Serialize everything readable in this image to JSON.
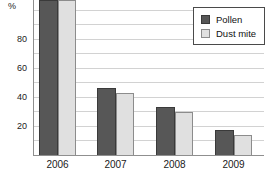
{
  "chart_data": {
    "type": "bar",
    "title": "",
    "categories": [
      "2006",
      "2007",
      "2008",
      "2009"
    ],
    "series": [
      {
        "name": "Pollen",
        "values": [
          100,
          46,
          33,
          17
        ],
        "color": "#575757",
        "border_color": "#3a3a3a"
      },
      {
        "name": "Dust mite",
        "values": [
          100,
          43,
          30,
          14
        ],
        "color": "#e0e0e0",
        "border_color": "#8c8c8c"
      }
    ],
    "ylabel": "%",
    "xlabel": "",
    "ylim": [
      0,
      100
    ],
    "ytick_labels": [
      "20",
      "40",
      "60",
      "80"
    ],
    "yticks": [
      20,
      40,
      60,
      80
    ],
    "gridline_step": 10,
    "grid": "on",
    "legend_position": "top-right",
    "note_2006_bars": "bars reach top edge of image (clipped at 100%)"
  },
  "colors": {
    "background": "#ffffff",
    "gridline": "#d2d2d2",
    "axis": "#8f8f8f",
    "text": "#1a1a1a"
  }
}
